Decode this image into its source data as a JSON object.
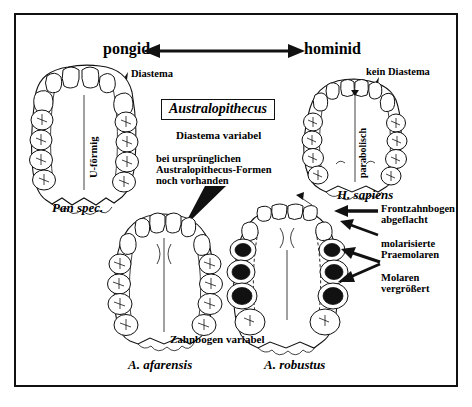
{
  "figure": {
    "title_axis": {
      "left_label": "pongid",
      "right_label": "hominid"
    },
    "center_box": {
      "label": "Australopithecus"
    },
    "center_text": {
      "line1": "Diastema variabel",
      "line2": "bei ursprünglichen",
      "line3": "Australopithecus-Formen",
      "line4": "noch vorhanden"
    },
    "annotations": {
      "diastema": "Diastema",
      "kein_diastema": "kein Diastema",
      "u_foermig": "U-förmig",
      "parabolisch": "parabolisch",
      "zahnbogen_variabel": "Zahnbogen variabel",
      "frontzahnbogen_1": "Frontzahnbogen",
      "frontzahnbogen_2": "abgeflacht",
      "praemolaren_1": "molarisierte",
      "praemolaren_2": "Praemolaren",
      "molaren_1": "Molaren",
      "molaren_2": "vergrößert"
    },
    "specimens": [
      {
        "name": "pan",
        "label": "Pan spec."
      },
      {
        "name": "homo",
        "label": "H. sapiens"
      },
      {
        "name": "afarensis",
        "label": "A. afarensis"
      },
      {
        "name": "robustus",
        "label": "A. robustus"
      }
    ],
    "caption": "",
    "colors": {
      "ink": "#111111",
      "paper": "#ffffff",
      "fill_black": "#111111"
    }
  }
}
